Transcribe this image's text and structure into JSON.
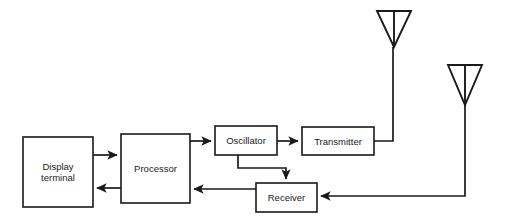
{
  "diagram": {
    "background_color": "#ffffff",
    "line_color": "#1a1a1a",
    "blocks": [
      {
        "id": "display-terminal",
        "label": "Display\nterminal",
        "x": 23,
        "y": 137,
        "w": 70,
        "h": 70
      },
      {
        "id": "processor",
        "label": "Processor",
        "x": 121,
        "y": 134,
        "w": 69,
        "h": 69
      },
      {
        "id": "oscillator",
        "label": "Oscillator",
        "x": 215,
        "y": 126,
        "w": 62,
        "h": 29
      },
      {
        "id": "transmitter",
        "label": "Transmitter",
        "x": 302,
        "y": 127,
        "w": 72,
        "h": 28
      },
      {
        "id": "receiver",
        "label": "Receiver",
        "x": 256,
        "y": 183,
        "w": 61,
        "h": 29
      }
    ],
    "antennas": [
      {
        "id": "transmit-antenna",
        "apex_x": 394,
        "top_y": 11,
        "half_width": 17,
        "tri_height": 36,
        "stem_bottom_y": 140
      },
      {
        "id": "receive-antenna",
        "apex_x": 465,
        "top_y": 65,
        "half_width": 17,
        "tri_height": 40,
        "stem_bottom_y": 196
      }
    ],
    "connections": [
      {
        "id": "display-to-processor",
        "from": "display-terminal",
        "to": "processor",
        "arrow": "right"
      },
      {
        "id": "processor-to-display",
        "from": "processor",
        "to": "display-terminal",
        "arrow": "left"
      },
      {
        "id": "processor-to-oscillator",
        "from": "processor",
        "to": "oscillator",
        "arrow": "right"
      },
      {
        "id": "oscillator-to-transmitter",
        "from": "oscillator",
        "to": "transmitter",
        "arrow": "right"
      },
      {
        "id": "oscillator-to-receiver",
        "from": "oscillator",
        "to": "receiver",
        "arrow": "down"
      },
      {
        "id": "transmitter-to-antenna",
        "from": "transmitter",
        "to": "transmit-antenna",
        "arrow": "none"
      },
      {
        "id": "antenna-to-receiver",
        "from": "receive-antenna",
        "to": "receiver",
        "arrow": "left"
      },
      {
        "id": "receiver-to-processor",
        "from": "receiver",
        "to": "processor",
        "arrow": "left"
      }
    ]
  }
}
